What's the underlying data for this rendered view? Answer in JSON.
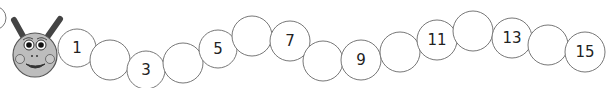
{
  "caterpillar": {
    "head": {
      "cx": 35,
      "cy": 55,
      "r": 22,
      "fill": "#bdbdbd"
    },
    "partial_circle": {
      "cx": -6,
      "cy": 18,
      "r": 12
    },
    "segments": [
      {
        "cx": 77,
        "cy": 48,
        "r": 19,
        "label": "1"
      },
      {
        "cx": 110,
        "cy": 60,
        "r": 20,
        "label": ""
      },
      {
        "cx": 146,
        "cy": 70,
        "r": 19,
        "label": "3"
      },
      {
        "cx": 183,
        "cy": 63,
        "r": 20,
        "label": ""
      },
      {
        "cx": 218,
        "cy": 49,
        "r": 19,
        "label": "5"
      },
      {
        "cx": 252,
        "cy": 36,
        "r": 20,
        "label": ""
      },
      {
        "cx": 290,
        "cy": 41,
        "r": 20,
        "label": "7"
      },
      {
        "cx": 323,
        "cy": 61,
        "r": 20,
        "label": ""
      },
      {
        "cx": 361,
        "cy": 60,
        "r": 20,
        "label": "9"
      },
      {
        "cx": 400,
        "cy": 52,
        "r": 20,
        "label": ""
      },
      {
        "cx": 437,
        "cy": 40,
        "r": 20,
        "label": "11"
      },
      {
        "cx": 473,
        "cy": 31,
        "r": 20,
        "label": ""
      },
      {
        "cx": 512,
        "cy": 38,
        "r": 20,
        "label": "13"
      },
      {
        "cx": 548,
        "cy": 45,
        "r": 20,
        "label": ""
      },
      {
        "cx": 585,
        "cy": 52,
        "r": 20,
        "label": "15"
      }
    ]
  }
}
